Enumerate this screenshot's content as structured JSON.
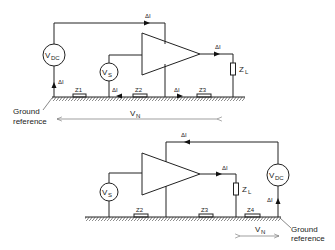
{
  "figure": {
    "top_circuit": {
      "source_dc": {
        "label": "V",
        "sub": "DC"
      },
      "source_signal": {
        "label": "V",
        "sub": "S"
      },
      "current_labels": [
        "ΔI",
        "ΔI",
        "ΔI",
        "ΔI",
        "ΔI"
      ],
      "impedances": [
        "Z1",
        "Z2",
        "Z3"
      ],
      "load": {
        "label": "Z",
        "sub": "L"
      },
      "ground_ref": [
        "Ground",
        "reference"
      ],
      "noise_voltage": {
        "label": "V",
        "sub": "N"
      }
    },
    "bottom_circuit": {
      "source_dc": {
        "label": "V",
        "sub": "DC"
      },
      "source_signal": {
        "label": "V",
        "sub": "S"
      },
      "current_labels": [
        "ΔI",
        "ΔI",
        "ΔI"
      ],
      "impedances": [
        "Z2",
        "Z3",
        "Z4"
      ],
      "load": {
        "label": "Z",
        "sub": "L"
      },
      "ground_ref": [
        "Ground",
        "reference"
      ],
      "noise_voltage": {
        "label": "V",
        "sub": "N"
      }
    }
  }
}
